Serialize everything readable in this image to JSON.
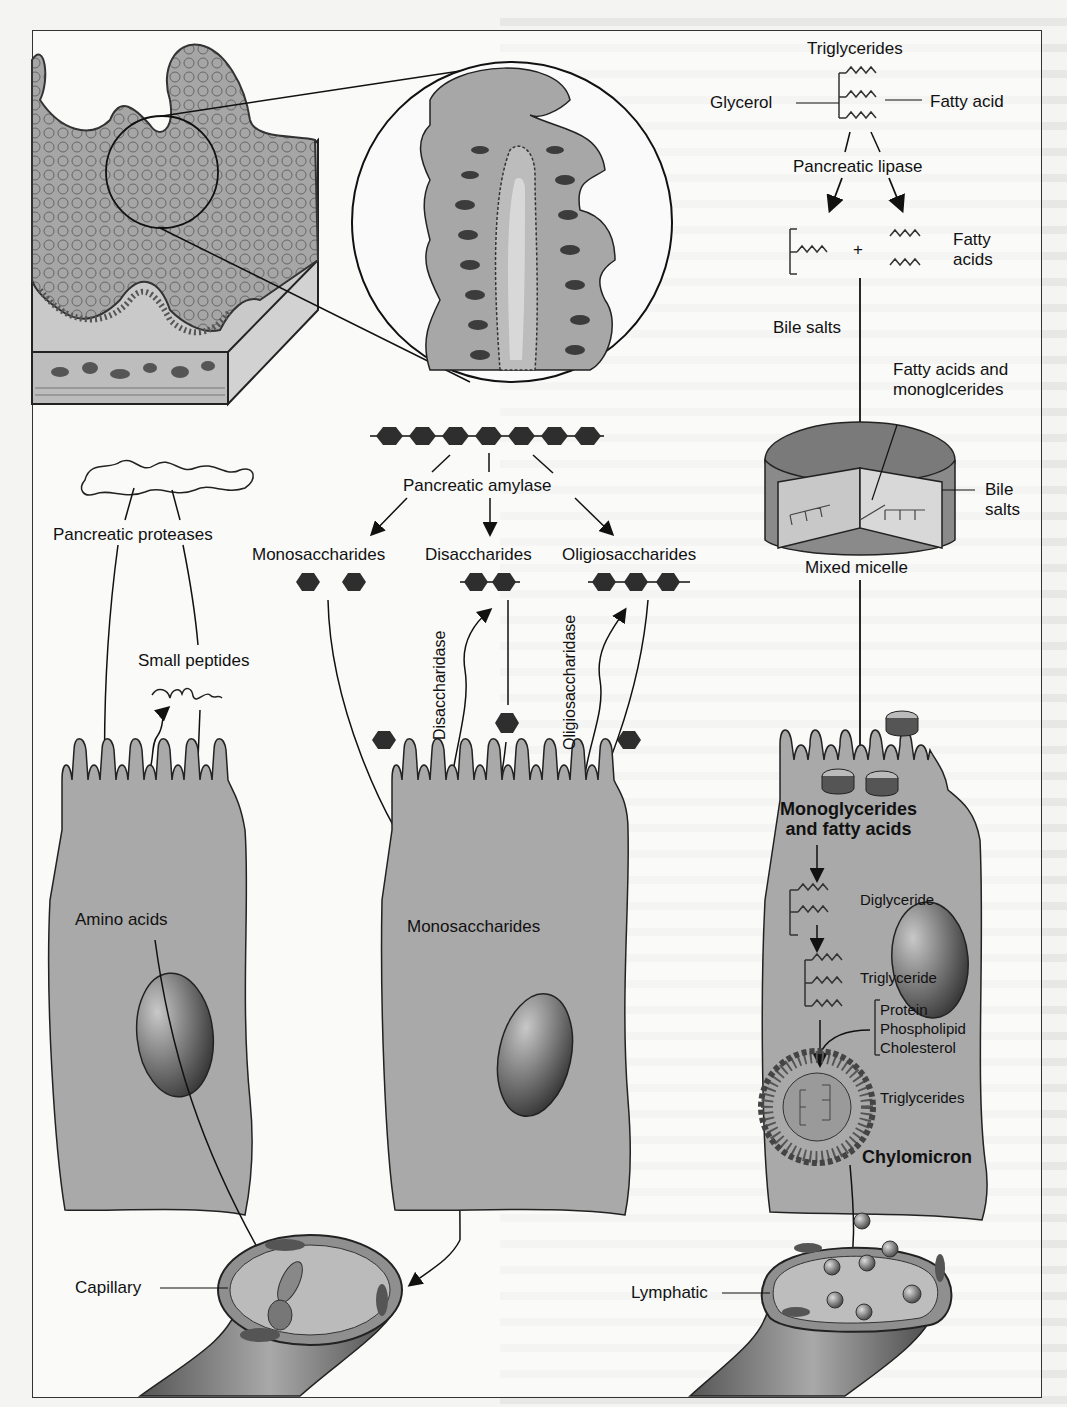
{
  "figure": {
    "panels": {
      "proteins": {
        "enzyme": "Pancreatic proteases",
        "intermediate": "Small peptides",
        "product": "Amino acids",
        "destination": "Capillary"
      },
      "carbohydrates": {
        "enzyme": "Pancreatic amylase",
        "products": [
          "Monosaccharides",
          "Disaccharides",
          "Oligiosaccharides"
        ],
        "brush_border_enzymes": [
          "Disaccharidase",
          "Oligiosaccharidase"
        ],
        "absorbed": "Monosaccharides"
      },
      "fats": {
        "substrate": "Triglycerides",
        "glycerol_label": "Glycerol",
        "fatty_acid_label": "Fatty acid",
        "enzyme": "Pancreatic lipase",
        "plus": "+",
        "fatty_acids_label": "Fatty\nacids",
        "bile_salts_arrow": "Bile salts",
        "micelle_contents": "Fatty acids and\nmonoglcerides",
        "micelle_bile_salts": "Bile\nsalts",
        "micelle": "Mixed micelle",
        "absorbed": "Monoglycerides\nand fatty acids",
        "diglyceride": "Diglyceride",
        "triglyceride": "Triglyceride",
        "coat": [
          "Protein",
          "Phospholipid",
          "Cholesterol"
        ],
        "core": "Triglycerides",
        "chylomicron": "Chylomicron",
        "destination": "Lymphatic"
      }
    },
    "colors": {
      "cell_fill": "#a9a9a9",
      "outline": "#1a1a1a",
      "hexagon": "#2e2e2e",
      "nucleus_dark": "#3a3a3a",
      "background": "#f4f4f2"
    }
  }
}
